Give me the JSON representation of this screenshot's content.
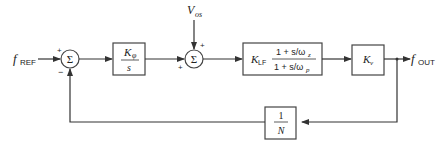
{
  "diagram": {
    "type": "block-diagram",
    "title": "",
    "input": {
      "symbol": "f",
      "subscript": "REF"
    },
    "output": {
      "symbol": "f",
      "subscript": "OUT"
    },
    "disturbance": {
      "symbol": "V",
      "subscript": "os"
    },
    "sum1": {
      "glyph": "Σ",
      "sign_top": "+",
      "sign_bottom": "−"
    },
    "sum2": {
      "glyph": "Σ",
      "sign_top": "+",
      "sign_left": "+"
    },
    "blocks": [
      {
        "id": "phase-detector",
        "numerator": "Kφ",
        "num_symbol": "K",
        "num_sub": "φ",
        "denominator": "s"
      },
      {
        "id": "loop-filter",
        "gain_symbol": "K",
        "gain_sub": "LF",
        "numerator": "1 + s/ωz",
        "denominator": "1 + s/ωp",
        "num_main": "1 + s/ω",
        "num_sub": "z",
        "den_main": "1 + s/ω",
        "den_sub": "p"
      },
      {
        "id": "vco",
        "gain_symbol": "K",
        "gain_sub": "v"
      },
      {
        "id": "divider",
        "numerator": "1",
        "denominator": "N"
      }
    ]
  }
}
